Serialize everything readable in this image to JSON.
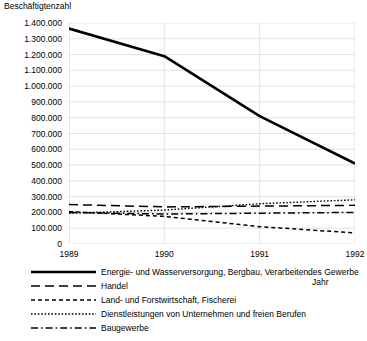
{
  "chart_data": {
    "type": "line",
    "title": "",
    "ylabel": "Beschäftigtenzahl",
    "xlabel": "Jahr",
    "grid": true,
    "legend_position": "bottom",
    "x": [
      1989,
      1990,
      1991,
      1992
    ],
    "xticklabels": [
      "1989",
      "1990",
      "1991",
      "1992"
    ],
    "ylim": [
      0,
      1400000
    ],
    "yticks": [
      0,
      100000,
      200000,
      300000,
      400000,
      500000,
      600000,
      700000,
      800000,
      900000,
      1000000,
      1100000,
      1200000,
      1300000,
      1400000
    ],
    "yticklabels": [
      "0",
      "100.000",
      "200.000",
      "300.000",
      "400.000",
      "500.000",
      "600.000",
      "700.000",
      "800.000",
      "900.000",
      "1.000.000",
      "1.100.000",
      "1.200.000",
      "1.300.000",
      "1.400.000"
    ],
    "series": [
      {
        "name": "Energie- und Wasserversorgung, Bergbau, Verarbeitendes Gewerbe",
        "style": "solid",
        "values": [
          1365000,
          1190000,
          810000,
          510000
        ]
      },
      {
        "name": "Handel",
        "style": "long-dash",
        "values": [
          250000,
          235000,
          240000,
          245000
        ]
      },
      {
        "name": "Land- und Forstwirtschaft, Fischerei",
        "style": "dash",
        "values": [
          205000,
          175000,
          110000,
          70000
        ]
      },
      {
        "name": "Dienstleistungen von Unternehmen und freien Berufen",
        "style": "dotted",
        "values": [
          195000,
          215000,
          255000,
          280000
        ]
      },
      {
        "name": "Baugewerbe",
        "style": "dash-dot",
        "values": [
          200000,
          190000,
          195000,
          200000
        ]
      }
    ]
  },
  "legend": {
    "items": [
      {
        "label": "Energie- und Wasserversorgung, Bergbau, Verarbeitendes Gewerbe",
        "style": "solid"
      },
      {
        "label": "Handel",
        "style": "long-dash"
      },
      {
        "label": "Land- und Forstwirtschaft, Fischerei",
        "style": "dash"
      },
      {
        "label": "Dienstleistungen von Unternehmen und freien Berufen",
        "style": "dotted"
      },
      {
        "label": "Baugewerbe",
        "style": "dash-dot"
      }
    ]
  },
  "colors": {
    "line": "#000000",
    "grid": "#d9d9d9",
    "axis": "#bfbfbf",
    "background": "#ffffff"
  }
}
